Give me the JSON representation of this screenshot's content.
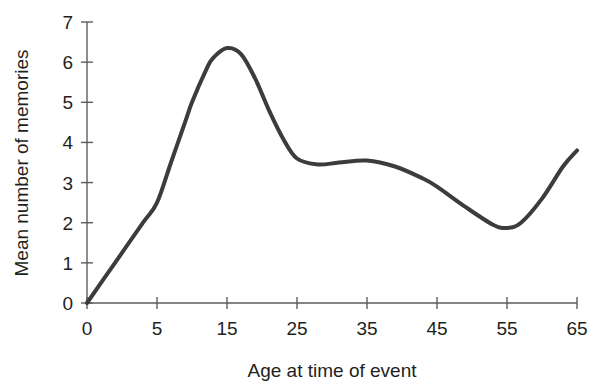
{
  "chart_data": {
    "type": "line",
    "title": "",
    "xlabel": "Age at time of event",
    "ylabel": "Mean number of memories",
    "x_tick_labels": [
      "0",
      "5",
      "15",
      "25",
      "35",
      "45",
      "55",
      "65"
    ],
    "x_tick_values": [
      0,
      5,
      15,
      25,
      35,
      45,
      55,
      65
    ],
    "x_axis_scale": "ordinal-equal-spacing",
    "y_tick_labels": [
      "0",
      "1",
      "2",
      "3",
      "4",
      "5",
      "6",
      "7"
    ],
    "y_tick_values": [
      0,
      1,
      2,
      3,
      4,
      5,
      6,
      7
    ],
    "ylim": [
      0,
      7
    ],
    "grid": false,
    "legend": false,
    "line_color": "#3c3c3c",
    "line_width_px": 4,
    "series": [
      {
        "name": "Mean number of memories",
        "points": [
          {
            "age": 0,
            "value": 0.0
          },
          {
            "age": 2,
            "value": 1.0
          },
          {
            "age": 4,
            "value": 2.0
          },
          {
            "age": 5,
            "value": 2.5
          },
          {
            "age": 7,
            "value": 3.5
          },
          {
            "age": 9,
            "value": 4.5
          },
          {
            "age": 10,
            "value": 5.0
          },
          {
            "age": 12,
            "value": 5.8
          },
          {
            "age": 13,
            "value": 6.1
          },
          {
            "age": 15,
            "value": 6.35
          },
          {
            "age": 17,
            "value": 6.2
          },
          {
            "age": 19,
            "value": 5.6
          },
          {
            "age": 21,
            "value": 4.8
          },
          {
            "age": 23,
            "value": 4.1
          },
          {
            "age": 25,
            "value": 3.6
          },
          {
            "age": 28,
            "value": 3.45
          },
          {
            "age": 31,
            "value": 3.5
          },
          {
            "age": 35,
            "value": 3.55
          },
          {
            "age": 39,
            "value": 3.4
          },
          {
            "age": 43,
            "value": 3.1
          },
          {
            "age": 45,
            "value": 2.9
          },
          {
            "age": 49,
            "value": 2.4
          },
          {
            "age": 53,
            "value": 1.95
          },
          {
            "age": 55,
            "value": 1.87
          },
          {
            "age": 57,
            "value": 2.0
          },
          {
            "age": 60,
            "value": 2.6
          },
          {
            "age": 63,
            "value": 3.4
          },
          {
            "age": 65,
            "value": 3.8
          }
        ]
      }
    ]
  }
}
